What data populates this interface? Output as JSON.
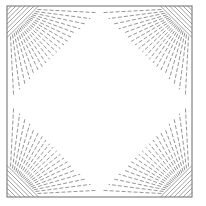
{
  "canvas": {
    "width": 206,
    "height": 206,
    "background": "#ffffff"
  },
  "frame": {
    "x": 7,
    "y": 6,
    "width": 185,
    "height": 191,
    "stroke": "#6a6a6a",
    "stroke_width": 1
  },
  "style": {
    "ray_stroke": "#7a7a7a",
    "ray_width": 0.8,
    "ray_dash": "4 2",
    "hatch_stroke": "#7a7a7a",
    "hatch_width": 0.7
  },
  "corners": [
    {
      "name": "top-left",
      "cx": 7,
      "cy": 6,
      "sx": 1,
      "sy": 1
    },
    {
      "name": "top-right",
      "cx": 192,
      "cy": 6,
      "sx": -1,
      "sy": 1
    },
    {
      "name": "bottom-left",
      "cx": 7,
      "cy": 197,
      "sx": 1,
      "sy": -1
    },
    {
      "name": "bottom-right",
      "cx": 192,
      "cy": 197,
      "sx": -1,
      "sy": -1
    }
  ],
  "fan": {
    "ray_count": 20,
    "angle_start_deg": 3,
    "angle_end_deg": 87,
    "inner_sum": 30,
    "outer_sum": 92
  },
  "hatch": {
    "line_count": 7,
    "max_sum": 34,
    "spacing": 4.5
  }
}
